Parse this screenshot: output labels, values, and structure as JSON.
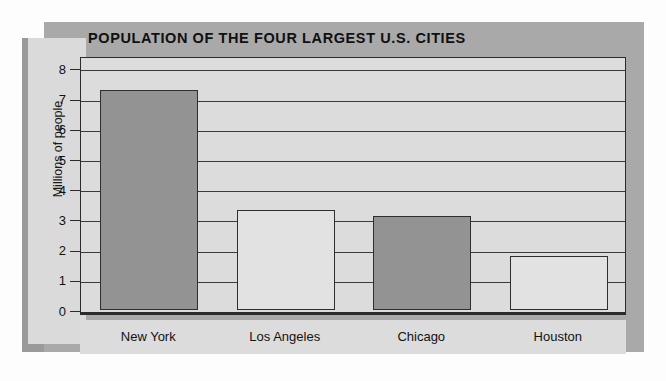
{
  "chart_data": {
    "type": "bar",
    "title": "POPULATION OF THE FOUR LARGEST U.S. CITIES",
    "xlabel": "",
    "ylabel": "Millions of people",
    "categories": [
      "New York",
      "Los Angeles",
      "Chicago",
      "Houston"
    ],
    "values": [
      7.3,
      3.3,
      3.1,
      1.8
    ],
    "bar_colors": [
      "#939393",
      "#e2e2e2",
      "#939393",
      "#e2e2e2"
    ],
    "ylim": [
      0,
      8.5
    ],
    "yticks": [
      0,
      1,
      2,
      3,
      4,
      5,
      6,
      7,
      8
    ],
    "ytick_labels": [
      "0",
      "1",
      "2",
      "3",
      "4",
      "5",
      "6",
      "7",
      "8"
    ],
    "grid": true,
    "legend": "none",
    "colors": {
      "panel": "#a9a9a9",
      "plot_background": "#dcdcdc",
      "axis_panel": "#dadada",
      "axis_line": "#2b2b2b",
      "page_background": "#fdfdfd",
      "text": "#111111"
    }
  }
}
